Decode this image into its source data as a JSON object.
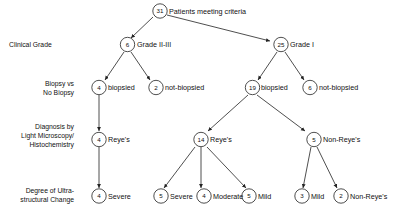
{
  "diagram": {
    "title_node": {
      "count": "31",
      "label": "Patients meeting criteria"
    },
    "row_labels": [
      {
        "id": "clinical-grade",
        "text": "Clinical Grade",
        "align": "left"
      },
      {
        "id": "biopsy-vs-no-biopsy",
        "line1": "Biopsy vs",
        "line2": "No Biopsy",
        "align": "right"
      },
      {
        "id": "diagnosis",
        "line1": "Diagnosis by",
        "line2": "Light Microscopy/",
        "line3": "Histochemistry",
        "align": "right"
      },
      {
        "id": "ultrastructural-change",
        "line1": "Degree of Ultra-",
        "line2": "structural Change",
        "align": "right"
      }
    ],
    "nodes": {
      "root": {
        "count": "31",
        "label": "Patients meeting criteria"
      },
      "grade_2_3": {
        "count": "6",
        "label": "Grade II-III"
      },
      "grade_1": {
        "count": "25",
        "label": "Grade I"
      },
      "g23_biopsied": {
        "count": "4",
        "label": "biopsied"
      },
      "g23_not_biopsied": {
        "count": "2",
        "label": "not-biopsied"
      },
      "g1_biopsied": {
        "count": "19",
        "label": "biopsied"
      },
      "g1_not_biopsied": {
        "count": "6",
        "label": "not-biopsied"
      },
      "g23_reyes": {
        "count": "4",
        "label": "Reye's"
      },
      "g1_reyes": {
        "count": "14",
        "label": "Reye's"
      },
      "g1_non_reyes": {
        "count": "5",
        "label": "Non-Reye's"
      },
      "g23_severe": {
        "count": "4",
        "label": "Severe"
      },
      "g1_severe": {
        "count": "5",
        "label": "Severe"
      },
      "g1_moderate": {
        "count": "4",
        "label": "Moderate"
      },
      "g1_mild": {
        "count": "5",
        "label": "Mild"
      },
      "nr_mild": {
        "count": "3",
        "label": "Mild"
      },
      "nr_non_reyes": {
        "count": "2",
        "label": "Non-Reye's"
      }
    },
    "colors": {
      "stroke": "#222222",
      "text": "#111111",
      "background": "#ffffff"
    }
  }
}
